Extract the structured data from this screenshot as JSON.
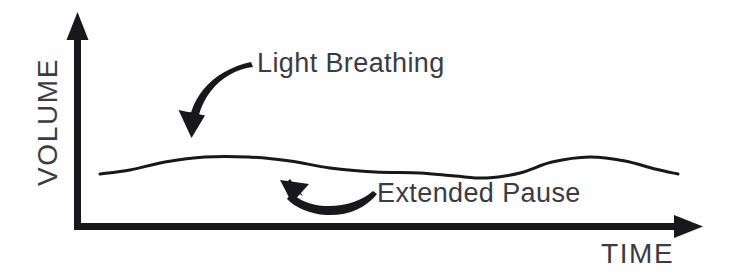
{
  "diagram": {
    "type": "annotated-line-graph",
    "background_color": "#fefefe",
    "ink_color": "#17171c",
    "text_color": "#3b3b43",
    "axes": {
      "y_label": "VOLUME",
      "x_label": "TIME",
      "origin": {
        "x": 77,
        "y": 226
      },
      "y_axis_top": {
        "x": 77,
        "y": 14
      },
      "x_axis_right": {
        "x": 702,
        "y": 226
      },
      "y_arrowhead": "up-triangle",
      "x_arrowhead": "right-triangle",
      "stroke_width": 7
    },
    "annotations": [
      {
        "name": "light-breathing",
        "label": "Light Breathing",
        "x": 257,
        "y": 48,
        "arrow": "curved-arrow-down-left",
        "arrow_from": {
          "x": 250,
          "y": 63
        },
        "arrow_to": {
          "x": 191,
          "y": 137
        }
      },
      {
        "name": "extended-pause",
        "label": "Extended Pause",
        "x": 377,
        "y": 178,
        "arrow": "curved-arrow-up-left",
        "arrow_from": {
          "x": 374,
          "y": 194
        },
        "arrow_to": {
          "x": 281,
          "y": 180
        }
      }
    ]
  },
  "chart_data": {
    "type": "line",
    "title": "",
    "xlabel": "TIME",
    "ylabel": "VOLUME",
    "grid": false,
    "legend": "none",
    "axis_style": "arrow-axes-unlabeled-ticks",
    "xlim": [
      77,
      702
    ],
    "ylim": [
      226,
      14
    ],
    "series": [
      {
        "name": "Breath volume",
        "stroke_color": "#17171c",
        "stroke_width": 3,
        "points": [
          {
            "x": 100,
            "y": 174
          },
          {
            "x": 130,
            "y": 170
          },
          {
            "x": 165,
            "y": 162
          },
          {
            "x": 205,
            "y": 157
          },
          {
            "x": 248,
            "y": 157
          },
          {
            "x": 290,
            "y": 161
          },
          {
            "x": 330,
            "y": 168
          },
          {
            "x": 375,
            "y": 172
          },
          {
            "x": 420,
            "y": 173
          },
          {
            "x": 455,
            "y": 176
          },
          {
            "x": 487,
            "y": 178
          },
          {
            "x": 520,
            "y": 173
          },
          {
            "x": 552,
            "y": 162
          },
          {
            "x": 590,
            "y": 157
          },
          {
            "x": 625,
            "y": 161
          },
          {
            "x": 655,
            "y": 169
          },
          {
            "x": 678,
            "y": 174
          }
        ]
      }
    ]
  }
}
